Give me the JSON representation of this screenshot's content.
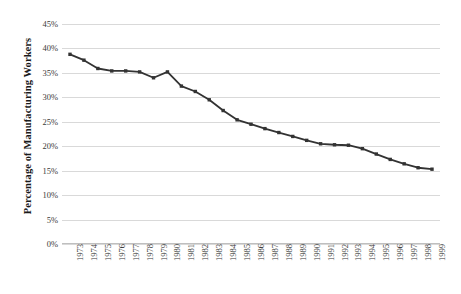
{
  "chart_data": {
    "type": "line",
    "title": "",
    "xlabel": "",
    "ylabel": "Percentage of Manufacturing Workers",
    "ylim": [
      0,
      45
    ],
    "ytick_labels": [
      "45%",
      "40%",
      "35%",
      "30%",
      "25%",
      "20%",
      "15%",
      "10%",
      "5%",
      "0%"
    ],
    "ytick_values": [
      45,
      40,
      35,
      30,
      25,
      20,
      15,
      10,
      5,
      0
    ],
    "grid": true,
    "legend": "none",
    "marker": "square",
    "line_color": "#333333",
    "grid_color": "#d9d9d9",
    "categories": [
      "1973",
      "1974",
      "1975",
      "1976",
      "1977",
      "1978",
      "1979",
      "1980",
      "1981",
      "1982",
      "1983",
      "1984",
      "1985",
      "1986",
      "1987",
      "1988",
      "1989",
      "1990",
      "1991",
      "1992",
      "1993",
      "1994",
      "1995",
      "1996",
      "1997",
      "1998",
      "1999"
    ],
    "values": [
      38.8,
      37.6,
      35.9,
      35.4,
      35.4,
      35.2,
      34.0,
      35.2,
      32.3,
      31.2,
      29.5,
      27.3,
      25.4,
      24.5,
      23.6,
      22.8,
      22.0,
      21.2,
      20.5,
      20.3,
      20.2,
      19.5,
      18.4,
      17.3,
      16.4,
      15.6,
      15.3
    ]
  }
}
